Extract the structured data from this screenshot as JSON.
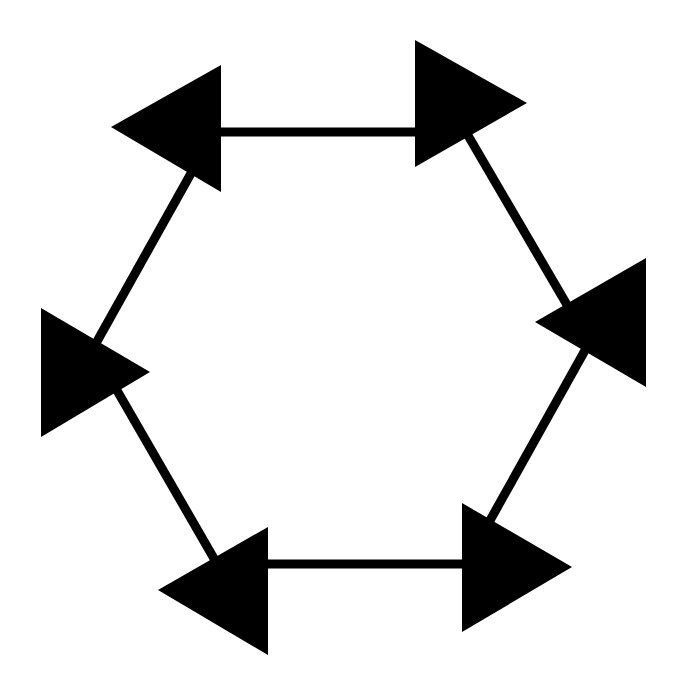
{
  "diagram": {
    "type": "hexagonal-cycle",
    "background": "#ffffff",
    "ink_color": "#000000",
    "edge_width": 9,
    "nodes": [
      {
        "id": "top-left",
        "shape": "triangle",
        "direction": "left",
        "points": "111,127 221,65 221,192"
      },
      {
        "id": "top-right",
        "shape": "triangle",
        "direction": "right",
        "points": "415,40 527,103 415,167"
      },
      {
        "id": "right",
        "shape": "triangle",
        "direction": "left",
        "points": "535,322 646,258 646,387"
      },
      {
        "id": "bottom-right",
        "shape": "triangle",
        "direction": "right",
        "points": "462,503 572,567 462,632"
      },
      {
        "id": "bottom-left",
        "shape": "triangle",
        "direction": "left",
        "points": "158,590 268,527 268,655"
      },
      {
        "id": "left",
        "shape": "triangle",
        "direction": "right",
        "points": "41,308 150,372 41,437"
      }
    ],
    "edges": [
      {
        "id": "edge-top",
        "from": "top-left",
        "to": "top-right",
        "x1": 215,
        "y1": 132,
        "x2": 420,
        "y2": 132
      },
      {
        "id": "edge-upper-right",
        "from": "top-right",
        "to": "right",
        "x1": 466,
        "y1": 132,
        "x2": 570,
        "y2": 310
      },
      {
        "id": "edge-lower-right",
        "from": "right",
        "to": "bottom-right",
        "x1": 588,
        "y1": 345,
        "x2": 488,
        "y2": 524
      },
      {
        "id": "edge-bottom",
        "from": "bottom-right",
        "to": "bottom-left",
        "x1": 467,
        "y1": 564,
        "x2": 262,
        "y2": 564
      },
      {
        "id": "edge-lower-left",
        "from": "bottom-left",
        "to": "left",
        "x1": 216,
        "y1": 562,
        "x2": 115,
        "y2": 387
      },
      {
        "id": "edge-upper-left",
        "from": "left",
        "to": "top-left",
        "x1": 95,
        "y1": 345,
        "x2": 194,
        "y2": 168
      }
    ]
  }
}
